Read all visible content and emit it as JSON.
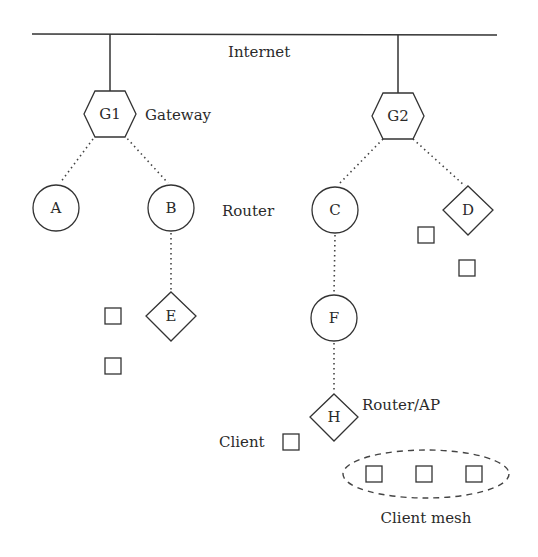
{
  "diagram": {
    "type": "network-topology",
    "labels": {
      "internet": "Internet",
      "gateway": "Gateway",
      "router": "Router",
      "router_ap": "Router/AP",
      "client": "Client",
      "client_mesh": "Client mesh"
    },
    "nodes": [
      {
        "id": "G1",
        "label": "G1",
        "shape": "hexagon",
        "role": "Gateway"
      },
      {
        "id": "G2",
        "label": "G2",
        "shape": "hexagon",
        "role": "Gateway"
      },
      {
        "id": "A",
        "label": "A",
        "shape": "circle",
        "role": "Router"
      },
      {
        "id": "B",
        "label": "B",
        "shape": "circle",
        "role": "Router"
      },
      {
        "id": "C",
        "label": "C",
        "shape": "circle",
        "role": "Router"
      },
      {
        "id": "F",
        "label": "F",
        "shape": "circle",
        "role": "Router"
      },
      {
        "id": "D",
        "label": "D",
        "shape": "diamond",
        "role": "Router/AP"
      },
      {
        "id": "E",
        "label": "E",
        "shape": "diamond",
        "role": "Router/AP"
      },
      {
        "id": "H",
        "label": "H",
        "shape": "diamond",
        "role": "Router/AP"
      }
    ],
    "edges": [
      {
        "from": "Internet",
        "to": "G1",
        "style": "solid"
      },
      {
        "from": "Internet",
        "to": "G2",
        "style": "solid"
      },
      {
        "from": "G1",
        "to": "A",
        "style": "dotted"
      },
      {
        "from": "G1",
        "to": "B",
        "style": "dotted"
      },
      {
        "from": "G2",
        "to": "C",
        "style": "dotted"
      },
      {
        "from": "G2",
        "to": "D",
        "style": "dotted"
      },
      {
        "from": "B",
        "to": "E",
        "style": "dotted"
      },
      {
        "from": "C",
        "to": "F",
        "style": "dotted"
      },
      {
        "from": "F",
        "to": "H",
        "style": "dotted"
      }
    ],
    "clients": {
      "near_E": 2,
      "near_D": 2,
      "near_H": 1,
      "mesh": 3
    }
  }
}
